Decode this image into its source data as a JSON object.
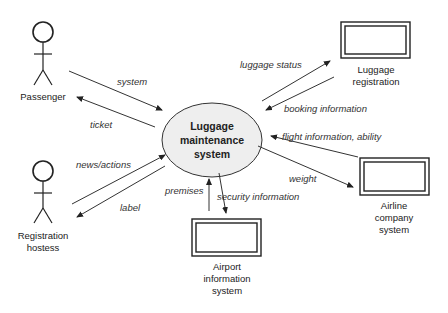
{
  "diagram": {
    "center": {
      "line1": "Luggage",
      "line2": "maintenance",
      "line3": "system"
    },
    "actors": {
      "passenger": {
        "label": "Passenger"
      },
      "hostess": {
        "line1": "Registration",
        "line2": "hostess"
      }
    },
    "systems": {
      "luggage_registration": {
        "line1": "Luggage",
        "line2": "registration"
      },
      "airline": {
        "line1": "Airline",
        "line2": "company",
        "line3": "system"
      },
      "airport": {
        "line1": "Airport",
        "line2": "information",
        "line3": "system"
      }
    },
    "flows": {
      "system": "system",
      "ticket": "ticket",
      "news_actions": "news/actions",
      "label": "label",
      "luggage_status": "luggage status",
      "booking_information": "booking information",
      "flight_information": "flight information, ability",
      "weight": "weight",
      "premises": "premises",
      "security_information": "security information"
    },
    "colors": {
      "ellipse_fill": "#eeeeee",
      "stroke": "#222222"
    }
  }
}
